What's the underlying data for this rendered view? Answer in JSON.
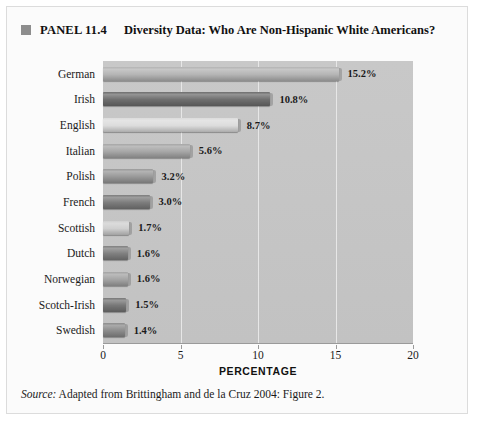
{
  "figure": {
    "panel_label": "PANEL 11.4",
    "panel_title": "Diversity Data: Who Are Non-Hispanic White Americans?",
    "bullet_color": "#8d8d8d",
    "source_label": "Source:",
    "source_text": "Adapted from Brittingham and de la Cruz 2004: Figure 2."
  },
  "chart_data": {
    "type": "bar",
    "orientation": "horizontal",
    "title": "Diversity Data: Who Are Non-Hispanic White Americans?",
    "xlabel": "PERCENTAGE",
    "ylabel": "",
    "xlim": [
      0,
      20
    ],
    "xticks": [
      "0",
      "5",
      "10",
      "15",
      "20"
    ],
    "grid": true,
    "grid_axis": "x",
    "legend": "none",
    "plot_background": "#c5c5c5",
    "categories": [
      "German",
      "Irish",
      "English",
      "Italian",
      "Polish",
      "French",
      "Scottish",
      "Dutch",
      "Norwegian",
      "Scotch-Irish",
      "Swedish"
    ],
    "values": [
      15.2,
      10.8,
      8.7,
      5.6,
      3.2,
      3.0,
      1.7,
      1.6,
      1.6,
      1.5,
      1.4
    ],
    "data_labels": [
      "15.2%",
      "10.8%",
      "8.7%",
      "5.6%",
      "3.2%",
      "3.0%",
      "1.7%",
      "1.6%",
      "1.6%",
      "1.5%",
      "1.4%"
    ],
    "bar_colors": [
      "#b4b4b4",
      "#6e6e6e",
      "#dcdcdc",
      "#a6a6a6",
      "#999999",
      "#7c7c7c",
      "#cfcfcf",
      "#7f7f7f",
      "#a3a3a3",
      "#767676",
      "#8c8c8c"
    ]
  }
}
